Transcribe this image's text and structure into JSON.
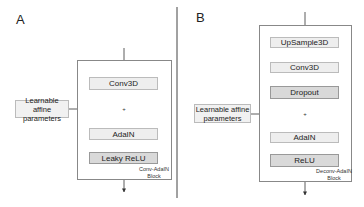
{
  "panels": [
    {
      "label": "A",
      "learnable": "Learnable affine parameters",
      "blocks": [
        "Conv3D",
        "AdaIN",
        "Leaky ReLU"
      ],
      "caption_line1": "Conv-AdaIN",
      "caption_line2": "Block",
      "sum_symbol": "+"
    },
    {
      "label": "B",
      "learnable": "Learnable affine parameters",
      "blocks": [
        "UpSample3D",
        "Conv3D",
        "Dropout",
        "AdaIN",
        "ReLU"
      ],
      "caption_line1": "Deconv-AdaIN",
      "caption_line2": "Block",
      "sum_symbol": "+"
    }
  ]
}
